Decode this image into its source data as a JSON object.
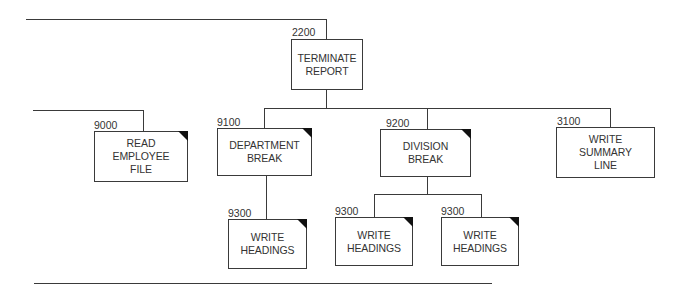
{
  "diagram": {
    "type": "structure chart",
    "nodes": [
      {
        "id": "2200",
        "number": "2200",
        "label": "TERMINATE\nREPORT",
        "predefined": false
      },
      {
        "id": "9000",
        "number": "9000",
        "label": "READ\nEMPLOYEE\nFILE",
        "predefined": true
      },
      {
        "id": "9100",
        "number": "9100",
        "label": "DEPARTMENT\nBREAK",
        "predefined": true
      },
      {
        "id": "9200",
        "number": "9200",
        "label": "DIVISION\nBREAK",
        "predefined": true
      },
      {
        "id": "3100",
        "number": "3100",
        "label": "WRITE\nSUMMARY\nLINE",
        "predefined": false
      },
      {
        "id": "9300a",
        "number": "9300",
        "label": "WRITE\nHEADINGS",
        "predefined": true
      },
      {
        "id": "9300b",
        "number": "9300",
        "label": "WRITE\nHEADINGS",
        "predefined": true
      },
      {
        "id": "9300c",
        "number": "9300",
        "label": "WRITE\nHEADINGS",
        "predefined": true
      }
    ],
    "edges": [
      {
        "from": "2200",
        "to": "9100"
      },
      {
        "from": "2200",
        "to": "9200"
      },
      {
        "from": "2200",
        "to": "3100"
      },
      {
        "from": "9100",
        "to": "9300a"
      },
      {
        "from": "9200",
        "to": "9300b"
      },
      {
        "from": "9200",
        "to": "9300c"
      }
    ]
  }
}
